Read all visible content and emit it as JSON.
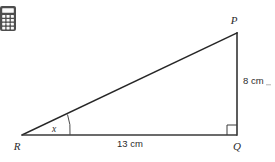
{
  "canvas": {
    "width": 275,
    "height": 162,
    "background": "#ffffff"
  },
  "toolbar": {
    "calculator_icon": "calculator-icon",
    "calculator_label": "Calculator",
    "icon_color": "#4d4d4d"
  },
  "figure": {
    "type": "right-triangle-diagram",
    "vertices": {
      "p": {
        "label": "P",
        "x": 237,
        "y": 33
      },
      "q": {
        "label": "Q",
        "x": 237,
        "y": 135
      },
      "r": {
        "label": "R",
        "x": 22,
        "y": 135
      }
    },
    "angle": {
      "label": "x",
      "at_vertex": "R"
    },
    "sides": {
      "vertical": {
        "label": "8 cm",
        "value": 8,
        "unit": "cm",
        "between": "PQ"
      },
      "horizontal": {
        "label": "13 cm",
        "value": 13,
        "unit": "cm",
        "between": "RQ"
      }
    },
    "right_angle_at": "Q",
    "line_color": "#262626",
    "text_color": "#2b2b2b"
  }
}
